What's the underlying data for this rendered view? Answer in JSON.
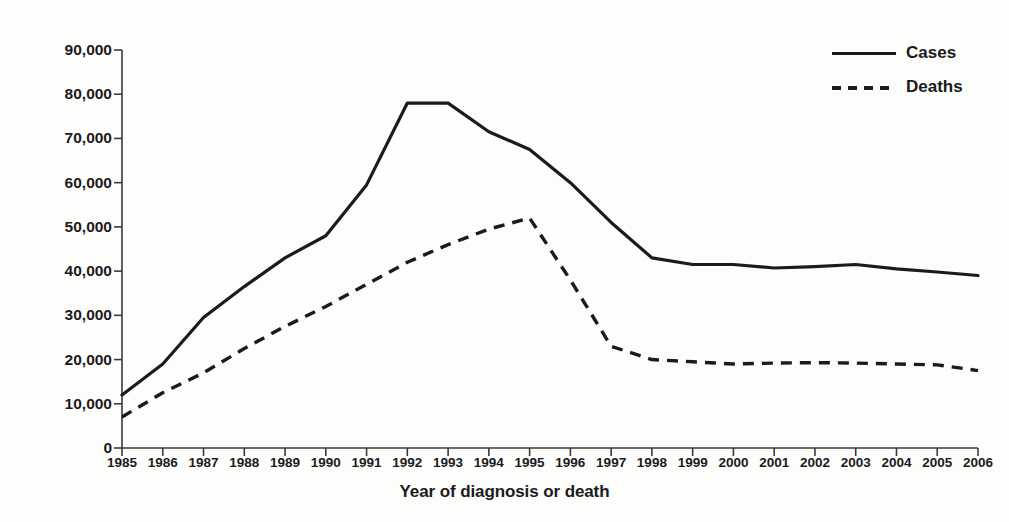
{
  "chart_data": {
    "type": "line",
    "title": "",
    "xlabel": "Year of diagnosis or death",
    "ylabel": "Number of cases or deaths",
    "x": [
      1985,
      1986,
      1987,
      1988,
      1989,
      1990,
      1991,
      1992,
      1993,
      1994,
      1995,
      1996,
      1997,
      1998,
      1999,
      2000,
      2001,
      2002,
      2003,
      2004,
      2005,
      2006
    ],
    "categories": [
      "1985",
      "1986",
      "1987",
      "1988",
      "1989",
      "1990",
      "1991",
      "1992",
      "1993",
      "1994",
      "1995",
      "1996",
      "1997",
      "1998",
      "1999",
      "2000",
      "2001",
      "2002",
      "2003",
      "2004",
      "2005",
      "2006"
    ],
    "series": [
      {
        "name": "Cases",
        "style": "solid",
        "color": "#1b1b1b",
        "values": [
          12000,
          19000,
          29500,
          36500,
          43000,
          48000,
          59500,
          78000,
          78000,
          71500,
          67500,
          60000,
          51000,
          43000,
          41500,
          41500,
          40700,
          41000,
          41500,
          40500,
          39800,
          39000
        ]
      },
      {
        "name": "Deaths",
        "style": "dashed",
        "color": "#1b1b1b",
        "values": [
          7000,
          12500,
          17000,
          22500,
          27500,
          32000,
          37000,
          42000,
          46000,
          49500,
          52000,
          38000,
          23000,
          20000,
          19500,
          19000,
          19200,
          19300,
          19200,
          19000,
          18800,
          17500
        ]
      }
    ],
    "xlim": [
      1985,
      2006
    ],
    "ylim": [
      0,
      90000
    ],
    "yticks": [
      0,
      10000,
      20000,
      30000,
      40000,
      50000,
      60000,
      70000,
      80000,
      90000
    ],
    "ytick_labels": [
      "0",
      "10,000",
      "20,000",
      "30,000",
      "40,000",
      "50,000",
      "60,000",
      "70,000",
      "80,000",
      "90,000"
    ],
    "grid": false,
    "legend_position": "top-right",
    "legend": [
      "Cases",
      "Deaths"
    ]
  },
  "axes": {
    "y_title": "Number of cases or deaths",
    "x_title": "Year of diagnosis or death"
  },
  "legend": {
    "items": [
      {
        "label": "Cases",
        "style": "solid"
      },
      {
        "label": "Deaths",
        "style": "dashed"
      }
    ]
  },
  "colors": {
    "ink": "#1b1b1b",
    "background": "#fdfdfc"
  }
}
